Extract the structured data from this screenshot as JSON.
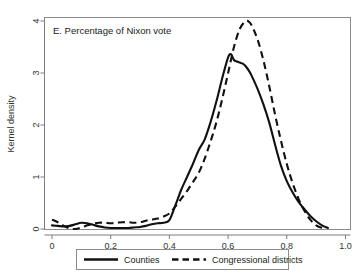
{
  "figure": {
    "panel_label": "E. Percentage of Nixon vote",
    "background_color": "#ffffff",
    "line_color": "#111111",
    "axis_color": "#7d7d7d"
  },
  "axes": {
    "x_ticklabels": [
      "0",
      "0.2",
      "0.4",
      "0.6",
      "0.8",
      "1.0"
    ],
    "y_ticklabels": [
      "0",
      "1",
      "2",
      "3",
      "4"
    ],
    "y_axis_title": "Kernel density",
    "x_axis_title": ""
  },
  "legend": {
    "entries": [
      {
        "label": "Counties",
        "style": "solid"
      },
      {
        "label": "Congressional districts",
        "style": "dashed"
      }
    ]
  },
  "chart_data": {
    "type": "line",
    "title": "E. Percentage of Nixon vote",
    "xlabel": "",
    "ylabel": "Kernel density",
    "xlim": [
      0.0,
      1.0
    ],
    "ylim": [
      0.0,
      4.2
    ],
    "xticks": [
      0.0,
      0.2,
      0.4,
      0.6,
      0.8,
      1.0
    ],
    "yticks": [
      0,
      1,
      2,
      3,
      4
    ],
    "grid": false,
    "legend_position": "below-axes",
    "annotations": [
      "E. Percentage of Nixon vote"
    ],
    "series": [
      {
        "name": "Counties",
        "style": "solid",
        "x": [
          0.0,
          0.02,
          0.04,
          0.06,
          0.08,
          0.1,
          0.12,
          0.14,
          0.16,
          0.18,
          0.2,
          0.22,
          0.24,
          0.26,
          0.28,
          0.3,
          0.32,
          0.34,
          0.36,
          0.38,
          0.4,
          0.42,
          0.44,
          0.46,
          0.48,
          0.5,
          0.52,
          0.54,
          0.56,
          0.58,
          0.6,
          0.61,
          0.62,
          0.63,
          0.64,
          0.65,
          0.66,
          0.67,
          0.68,
          0.7,
          0.72,
          0.74,
          0.76,
          0.78,
          0.8,
          0.82,
          0.84,
          0.86,
          0.88,
          0.9,
          0.92,
          0.94
        ],
        "y": [
          0.07,
          0.06,
          0.05,
          0.06,
          0.09,
          0.12,
          0.11,
          0.08,
          0.05,
          0.03,
          0.02,
          0.02,
          0.02,
          0.02,
          0.03,
          0.04,
          0.06,
          0.09,
          0.11,
          0.12,
          0.17,
          0.45,
          0.75,
          1.0,
          1.25,
          1.52,
          1.72,
          2.05,
          2.45,
          2.9,
          3.3,
          3.36,
          3.25,
          3.22,
          3.2,
          3.18,
          3.13,
          3.05,
          2.95,
          2.7,
          2.4,
          2.05,
          1.62,
          1.22,
          0.92,
          0.7,
          0.52,
          0.38,
          0.25,
          0.15,
          0.07,
          0.02
        ]
      },
      {
        "name": "Congressional districts",
        "style": "dashed",
        "x": [
          0.0,
          0.02,
          0.04,
          0.06,
          0.08,
          0.1,
          0.12,
          0.14,
          0.16,
          0.18,
          0.2,
          0.22,
          0.24,
          0.26,
          0.28,
          0.3,
          0.32,
          0.34,
          0.36,
          0.38,
          0.4,
          0.42,
          0.44,
          0.46,
          0.48,
          0.5,
          0.52,
          0.54,
          0.56,
          0.58,
          0.6,
          0.62,
          0.64,
          0.66,
          0.67,
          0.68,
          0.7,
          0.72,
          0.74,
          0.76,
          0.78,
          0.8,
          0.82,
          0.84,
          0.86,
          0.88,
          0.9,
          0.92
        ],
        "y": [
          0.18,
          0.13,
          0.06,
          0.01,
          0.0,
          0.03,
          0.07,
          0.1,
          0.12,
          0.12,
          0.11,
          0.12,
          0.13,
          0.13,
          0.12,
          0.13,
          0.16,
          0.18,
          0.2,
          0.24,
          0.3,
          0.43,
          0.58,
          0.73,
          0.9,
          1.08,
          1.35,
          1.68,
          2.05,
          2.5,
          3.0,
          3.5,
          3.85,
          4.0,
          3.99,
          3.92,
          3.65,
          3.25,
          2.75,
          2.2,
          1.7,
          1.25,
          0.88,
          0.58,
          0.35,
          0.18,
          0.07,
          0.02
        ]
      }
    ]
  }
}
